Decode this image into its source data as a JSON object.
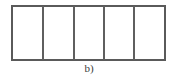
{
  "figure": {
    "caption": "b)",
    "colors": {
      "stroke": "#5a5a5a",
      "divider": "#5f5f5f",
      "fill": "#ffffff",
      "background": "#ffffff",
      "caption_text": "#3a3a3a"
    },
    "outline": {
      "x": 11,
      "y": 5,
      "width": 155,
      "height": 56,
      "stroke_width": 2
    },
    "dividers": [
      {
        "label": "divider-1",
        "x": 42.5
      },
      {
        "label": "divider-2",
        "x": 73.5
      },
      {
        "label": "divider-3",
        "x": 103.5
      },
      {
        "label": "divider-4",
        "x": 134.0
      }
    ],
    "cells": [
      {
        "label": "cell-1",
        "x": 12,
        "width": 29.5
      },
      {
        "label": "cell-2",
        "x": 43.5,
        "width": 29
      },
      {
        "label": "cell-3",
        "x": 74.5,
        "width": 28
      },
      {
        "label": "cell-4",
        "x": 104.5,
        "width": 28.5
      },
      {
        "label": "cell-5",
        "x": 135,
        "width": 30
      }
    ],
    "cell_count": 5
  }
}
